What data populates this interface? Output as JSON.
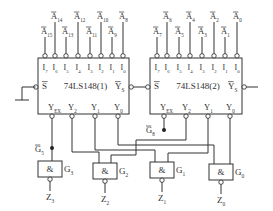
{
  "diagram": {
    "type": "logic-circuit",
    "chips": [
      {
        "id": "chip1",
        "label": "74LS148(1)",
        "inputs": [
          "I7",
          "I6",
          "I5",
          "I4",
          "I3",
          "I2",
          "I1",
          "I0"
        ],
        "input_signals": [
          "A15",
          "A14",
          "A13",
          "A12",
          "A11",
          "A10",
          "A9",
          "A8"
        ],
        "enable": "S",
        "outputs": [
          "YEX",
          "Y2",
          "Y1",
          "Y0"
        ],
        "ys": "YS"
      },
      {
        "id": "chip2",
        "label": "74LS148(2)",
        "inputs": [
          "I7",
          "I6",
          "I5",
          "I4",
          "I3",
          "I2",
          "I1",
          "I0"
        ],
        "input_signals": [
          "A7",
          "A6",
          "A5",
          "A4",
          "A3",
          "A2",
          "A1",
          "A0"
        ],
        "enable": "S",
        "outputs": [
          "YEX",
          "Y2",
          "Y1",
          "Y0"
        ],
        "ys": "YS"
      }
    ],
    "gates": [
      {
        "id": "G3",
        "symbol": "&",
        "output": "Z3"
      },
      {
        "id": "G2",
        "symbol": "&",
        "output": "Z2"
      },
      {
        "id": "G1",
        "symbol": "&",
        "output": "Z1"
      },
      {
        "id": "G0",
        "symbol": "&",
        "output": "Z0"
      }
    ],
    "node_labels": {
      "g5": "G5",
      "g8": "G8"
    }
  },
  "text": {
    "chip1_label": "74LS148(1)",
    "chip2_label": "74LS148(2)",
    "s": "S",
    "ys": "Y",
    "ys_sub": "S",
    "amp": "&"
  }
}
